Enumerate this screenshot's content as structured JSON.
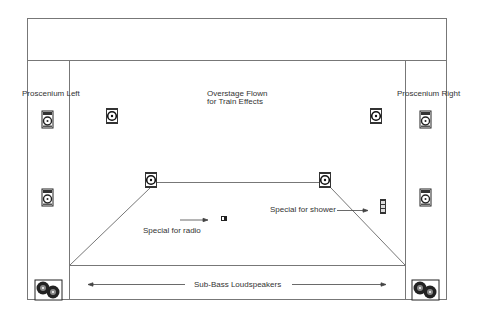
{
  "diagram": {
    "labels": {
      "proscenium_left": "Proscenium Left",
      "proscenium_right": "Proscenium Right",
      "overstage_line1": "Overstage Flown",
      "overstage_line2": "for Train Effects",
      "special_radio": "Special for radio",
      "special_shower": "Special for shower",
      "sub_bass": "Sub-Bass Loudspeakers"
    },
    "speakers": [
      {
        "id": "prosc-left-upper",
        "type": "full-range"
      },
      {
        "id": "prosc-left-lower",
        "type": "full-range"
      },
      {
        "id": "prosc-right-upper",
        "type": "full-range"
      },
      {
        "id": "prosc-right-lower",
        "type": "full-range"
      },
      {
        "id": "overstage-left",
        "type": "flown"
      },
      {
        "id": "overstage-right",
        "type": "flown"
      },
      {
        "id": "mid-left",
        "type": "flown"
      },
      {
        "id": "mid-right",
        "type": "flown"
      },
      {
        "id": "special-radio",
        "type": "small"
      },
      {
        "id": "special-shower",
        "type": "column"
      },
      {
        "id": "sub-left",
        "type": "sub-bass"
      },
      {
        "id": "sub-right",
        "type": "sub-bass"
      }
    ],
    "colors": {
      "line": "#777777",
      "icon": "#222222",
      "text": "#333333"
    }
  }
}
